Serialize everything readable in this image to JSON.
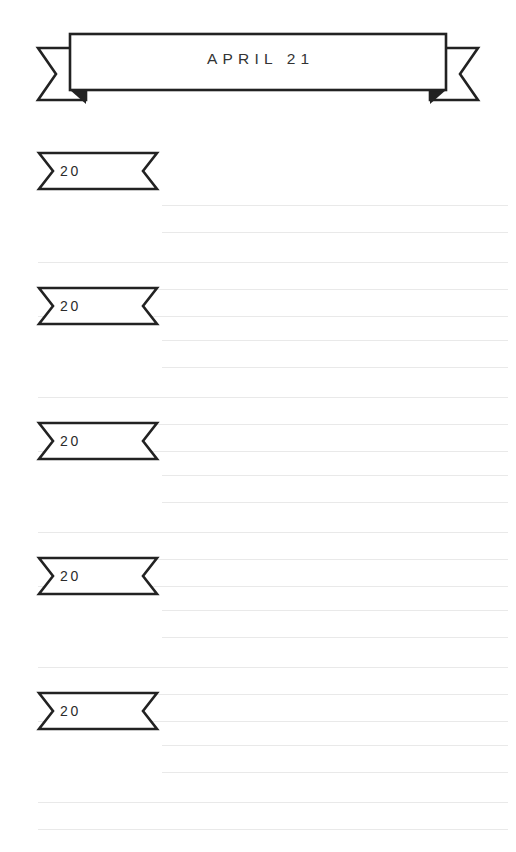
{
  "page": {
    "title": "APRIL 21",
    "background_color": "#ffffff",
    "ink_color": "#222222",
    "rule_color": "#e9e9e9"
  },
  "banner": {
    "title": "APRIL 21",
    "icon": "ribbon-banner-icon"
  },
  "entries": [
    {
      "year_label": "20",
      "icon": "notched-tag-icon",
      "short_rules": 2,
      "full_rules": 3
    },
    {
      "year_label": "20",
      "icon": "notched-tag-icon",
      "short_rules": 2,
      "full_rules": 3
    },
    {
      "year_label": "20",
      "icon": "notched-tag-icon",
      "short_rules": 2,
      "full_rules": 3
    },
    {
      "year_label": "20",
      "icon": "notched-tag-icon",
      "short_rules": 2,
      "full_rules": 3
    },
    {
      "year_label": "20",
      "icon": "notched-tag-icon",
      "short_rules": 2,
      "full_rules": 3
    }
  ]
}
